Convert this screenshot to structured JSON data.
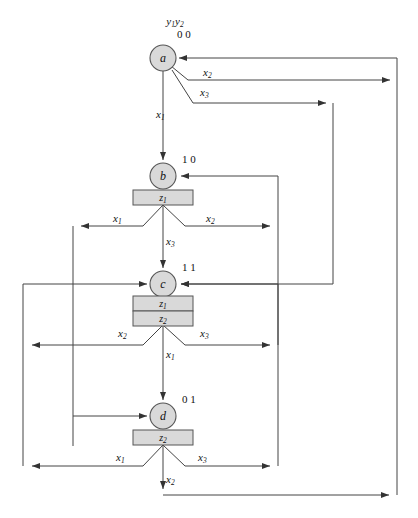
{
  "figure": {
    "type": "state-transition-diagram",
    "header_label": "y1y2",
    "header_var1": "y",
    "header_var1_sub": "1",
    "header_var2": "y",
    "header_var2_sub": "2"
  },
  "states": [
    {
      "id": "a",
      "name": "a",
      "code": "0 0",
      "outputs": [],
      "cx": 163,
      "cy": 58
    },
    {
      "id": "b",
      "name": "b",
      "code": "1 0",
      "outputs": [
        "z1"
      ],
      "cx": 163,
      "cy": 176
    },
    {
      "id": "c",
      "name": "c",
      "code": "1 1",
      "outputs": [
        "z1",
        "z2"
      ],
      "cx": 163,
      "cy": 284
    },
    {
      "id": "d",
      "name": "d",
      "code": "0 1",
      "outputs": [
        "z2"
      ],
      "cx": 163,
      "cy": 416
    }
  ],
  "output_labels": {
    "z1": {
      "var": "z",
      "sub": "1"
    },
    "z2": {
      "var": "z",
      "sub": "2"
    }
  },
  "input_labels": {
    "x1": {
      "var": "x",
      "sub": "1"
    },
    "x2": {
      "var": "x",
      "sub": "2"
    },
    "x3": {
      "var": "x",
      "sub": "3"
    }
  },
  "transitions": [
    {
      "from": "a",
      "input": "x1",
      "to": "b",
      "label_x": 156,
      "label_y": 118
    },
    {
      "from": "a",
      "input": "x2",
      "to": "a",
      "label_x": 203,
      "label_y": 76
    },
    {
      "from": "a",
      "input": "x3",
      "to": "c",
      "label_x": 200,
      "label_y": 96
    },
    {
      "from": "b",
      "input": "x1",
      "to": "a",
      "label_x": 113,
      "label_y": 222
    },
    {
      "from": "b",
      "input": "x2",
      "to": "b",
      "label_x": 206,
      "label_y": 222
    },
    {
      "from": "b",
      "input": "x3",
      "to": "c",
      "label_x": 170,
      "label_y": 245
    },
    {
      "from": "c",
      "input": "x2",
      "to": "a",
      "label_x": 122,
      "label_y": 337
    },
    {
      "from": "c",
      "input": "x3",
      "to": "c",
      "label_x": 202,
      "label_y": 337
    },
    {
      "from": "c",
      "input": "x1",
      "to": "d",
      "label_x": 170,
      "label_y": 358
    },
    {
      "from": "d",
      "input": "x1",
      "to": "c",
      "label_x": 120,
      "label_y": 461
    },
    {
      "from": "d",
      "input": "x3",
      "to": "b",
      "label_x": 200,
      "label_y": 461
    },
    {
      "from": "d",
      "input": "x2",
      "to": "a",
      "label_x": 170,
      "label_y": 483
    }
  ],
  "colors": {
    "node_fill": "#d9d9d9",
    "node_stroke": "#555555",
    "wire": "#444444",
    "background": "#ffffff",
    "text": "#111111"
  }
}
